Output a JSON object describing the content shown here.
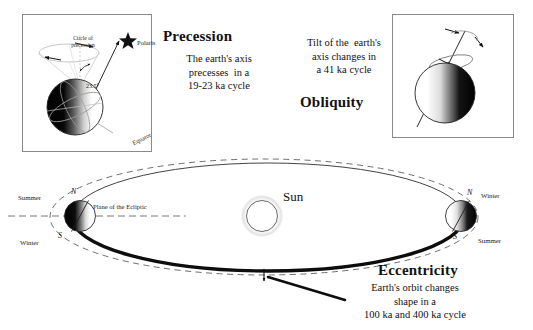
{
  "page": {
    "background": "#ffffff"
  },
  "panels": {
    "precession": {
      "heading": "Precession",
      "caption": "The earth's axis\nprecesses  in a\n19-23 ka cycle",
      "labels": {
        "circle_of_precession": "Circle of\nprecession",
        "polaris": "Polaris",
        "tilt_angle": "23.5°",
        "equator": "Equator"
      }
    },
    "obliquity": {
      "heading": "Obliquity",
      "caption": "Tilt of the  earth's\naxis changes in\na 41 ka cycle",
      "labels": {
        "axis_of_rotation": "Axis of\nrotation"
      }
    },
    "eccentricity": {
      "heading": "Eccentricity",
      "caption": "Earth's orbit changes\nshape in a\n100 ka and 400 ka cycle"
    }
  },
  "orbit": {
    "sun_label": "Sun",
    "plane_label": "Plane of the Ecliptic",
    "earth_left": {
      "north_pole": "N",
      "south_pole": "S",
      "top_season": "Summer",
      "bottom_season": "Winter"
    },
    "earth_right": {
      "north_pole": "N",
      "south_pole": "S",
      "top_season": "Winter",
      "bottom_season": "Summer"
    }
  },
  "colors": {
    "ink": "#111111",
    "line": "#3a3a3a",
    "dashed": "#5a5a5a",
    "box_border": "#8a8a8a",
    "shadow_dark": "#0a0a0a",
    "paper": "#ffffff"
  }
}
